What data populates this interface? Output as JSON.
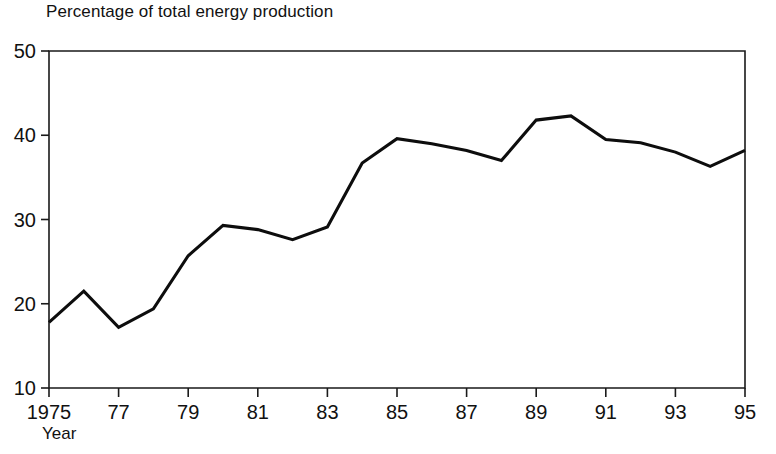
{
  "chart_data": {
    "type": "line",
    "title": "Percentage of total energy production",
    "xlabel": "Year",
    "ylabel": "",
    "xlim": [
      1975,
      1995
    ],
    "ylim": [
      10,
      50
    ],
    "grid": false,
    "legend": "none",
    "x_tick_labels": [
      "1975",
      "77",
      "79",
      "81",
      "83",
      "85",
      "87",
      "89",
      "91",
      "93",
      "95"
    ],
    "x_tick_values": [
      1975,
      1977,
      1979,
      1981,
      1983,
      1985,
      1987,
      1989,
      1991,
      1993,
      1995
    ],
    "y_tick_labels": [
      "10",
      "20",
      "30",
      "40",
      "50"
    ],
    "y_tick_values": [
      10,
      20,
      30,
      40,
      50
    ],
    "x": [
      1975,
      1976,
      1977,
      1978,
      1979,
      1980,
      1981,
      1982,
      1983,
      1984,
      1985,
      1986,
      1987,
      1988,
      1989,
      1990,
      1991,
      1992,
      1993,
      1994,
      1995
    ],
    "series": [
      {
        "name": "Percentage of total energy production",
        "color": "#0d0d0d",
        "values": [
          17.8,
          21.5,
          17.2,
          19.4,
          25.7,
          29.3,
          28.8,
          27.6,
          29.1,
          36.7,
          39.6,
          39.0,
          38.2,
          37.0,
          41.8,
          42.3,
          39.5,
          39.1,
          38.0,
          36.3,
          38.2
        ]
      }
    ]
  },
  "colors": {
    "axis": "#1a1a1a",
    "line": "#0d0d0d",
    "text": "#111111",
    "background": "#ffffff"
  }
}
